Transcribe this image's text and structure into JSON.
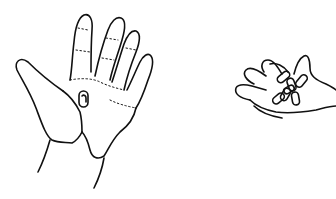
{
  "illustration": {
    "style": "black line drawing on white background",
    "colors": {
      "background": "#ffffff",
      "ink": "#111111"
    },
    "figures": [
      {
        "id": "left-hand",
        "description": "open right palm facing viewer holding a single small capsule/pill in the center of the palm"
      },
      {
        "id": "right-hand",
        "description": "smaller hand with fingers spread holding a cluster of several capsules/pills"
      }
    ]
  }
}
